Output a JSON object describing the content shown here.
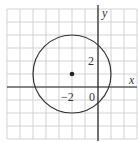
{
  "figure": {
    "type": "circle-on-grid",
    "grid": {
      "x_min": -7,
      "x_max": 3,
      "y_min": -4,
      "y_max": 6,
      "unit_px": 13,
      "color": "#c8c8c8"
    },
    "axes": {
      "x_label": "x",
      "y_label": "y",
      "color": "#222222"
    },
    "circle": {
      "center": [
        -2,
        1
      ],
      "radius": 3,
      "color": "#333333"
    },
    "center_point": {
      "x": -2,
      "y": 1
    },
    "tick_labels": {
      "y_two": "2",
      "x_neg_two": "−2",
      "origin": "0"
    }
  }
}
